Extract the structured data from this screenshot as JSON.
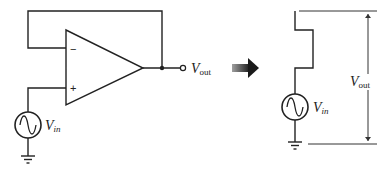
{
  "left_circuit": {
    "title": "Op-amp voltage follower",
    "opamp": {
      "inverting_label": "−",
      "noninverting_label": "+"
    },
    "source_label": {
      "main": "V",
      "sub": "in"
    },
    "output_label": {
      "main": "V",
      "sub": "out"
    }
  },
  "transform_arrow": "equivalent-to",
  "right_circuit": {
    "title": "Equivalent circuit",
    "source_label": {
      "main": "V",
      "sub": "in"
    },
    "dimension_label": {
      "main": "V",
      "sub": "out"
    }
  },
  "colors": {
    "wire": "#222222",
    "arrow_dark": "#1a1a1a",
    "arrow_light": "#9a9a9a",
    "background": "#ffffff"
  }
}
